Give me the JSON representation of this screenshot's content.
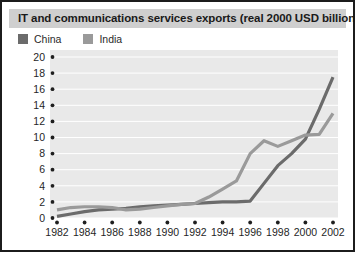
{
  "figure": {
    "title": "IT and communications services exports (real 2000 USD billion)",
    "caption": ""
  },
  "colors": {
    "china": "#6b6b6b",
    "india": "#9a9a9a",
    "plot_background": "#e9e9e9",
    "title_background": "#cfcfcf",
    "border": "#1c1c1c",
    "gridline": "#ffffff",
    "text": "#1f1f1f"
  },
  "chart_data": {
    "type": "line",
    "title": "IT and communications services exports (real 2000 USD billion)",
    "xlabel": "",
    "ylabel": "",
    "xlim": [
      1982,
      2002
    ],
    "ylim": [
      0,
      20
    ],
    "ytick_step": 2,
    "xtick_step": 2,
    "grid": true,
    "legend_position": "top-left",
    "x": [
      1982,
      1983,
      1984,
      1985,
      1986,
      1987,
      1988,
      1989,
      1990,
      1991,
      1992,
      1993,
      1994,
      1995,
      1996,
      1997,
      1998,
      1999,
      2000,
      2001,
      2002
    ],
    "ticklabels_y": [
      "0",
      "2",
      "4",
      "6",
      "8",
      "10",
      "12",
      "14",
      "16",
      "18",
      "20"
    ],
    "ticklabels_x": [
      "1982",
      "1984",
      "1986",
      "1988",
      "1990",
      "1992",
      "1994",
      "1996",
      "1998",
      "2000",
      "2002"
    ],
    "series": [
      {
        "name": "China",
        "color": "#6b6b6b",
        "values": [
          0.2,
          0.5,
          0.8,
          1.0,
          1.1,
          1.2,
          1.4,
          1.5,
          1.6,
          1.7,
          1.8,
          1.9,
          2.0,
          2.0,
          2.1,
          4.3,
          6.5,
          8.0,
          9.8,
          13.5,
          17.5
        ]
      },
      {
        "name": "India",
        "color": "#9a9a9a",
        "values": [
          1.0,
          1.3,
          1.4,
          1.4,
          1.3,
          1.0,
          1.1,
          1.3,
          1.5,
          1.7,
          1.8,
          2.6,
          3.6,
          4.6,
          8.0,
          9.6,
          8.9,
          9.6,
          10.3,
          10.4,
          13.0
        ]
      }
    ]
  },
  "legend": {
    "items": [
      {
        "label": "China",
        "color": "#6b6b6b"
      },
      {
        "label": "India",
        "color": "#9a9a9a"
      }
    ]
  }
}
